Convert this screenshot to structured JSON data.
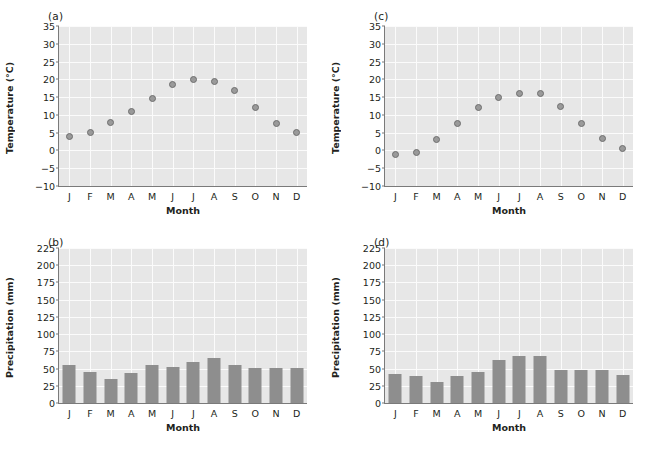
{
  "figure": {
    "months": [
      "J",
      "F",
      "M",
      "A",
      "M",
      "J",
      "J",
      "A",
      "S",
      "O",
      "N",
      "D"
    ],
    "xlabel": "Month",
    "temperature_axis_label": "Temperature (°C)",
    "precipitation_axis_label": "Precipitation (mm)",
    "temp_ticks": [
      "35",
      "30",
      "25",
      "20",
      "15",
      "10",
      "5",
      "0",
      "−5",
      "−10"
    ],
    "precip_ticks": [
      "225",
      "200",
      "175",
      "150",
      "125",
      "100",
      "75",
      "50",
      "25",
      "0"
    ],
    "marker_color": "#9a9a9a",
    "marker_edge_color": "#6e6e6e",
    "bar_color": "#8e8e8e",
    "plot_bg_color": "#e7e7e7",
    "grid_color": "#fbfbfb"
  },
  "panels": {
    "a": {
      "tag": "(a)"
    },
    "b": {
      "tag": "(b)"
    },
    "c": {
      "tag": "(c)"
    },
    "d": {
      "tag": "(d)"
    }
  },
  "chart_data": [
    {
      "panel": "a",
      "type": "scatter",
      "title": "(a)",
      "xlabel": "Month",
      "ylabel": "Temperature (°C)",
      "categories": [
        "J",
        "F",
        "M",
        "A",
        "M",
        "J",
        "J",
        "A",
        "S",
        "O",
        "N",
        "D"
      ],
      "values": [
        4,
        5,
        8,
        11,
        14.5,
        18.5,
        20,
        19.5,
        17,
        12,
        7.5,
        5
      ],
      "ylim": [
        -10,
        35
      ],
      "ytick_values": [
        -10,
        -5,
        0,
        5,
        10,
        15,
        20,
        25,
        30,
        35
      ],
      "grid": true,
      "legend": "none"
    },
    {
      "panel": "b",
      "type": "bar",
      "title": "(b)",
      "xlabel": "Month",
      "ylabel": "Precipitation (mm)",
      "categories": [
        "J",
        "F",
        "M",
        "A",
        "M",
        "J",
        "J",
        "A",
        "S",
        "O",
        "N",
        "D"
      ],
      "values": [
        55,
        45,
        35,
        43,
        55,
        52,
        59,
        65,
        55,
        51,
        51,
        51
      ],
      "ylim": [
        0,
        225
      ],
      "ytick_values": [
        0,
        25,
        50,
        75,
        100,
        125,
        150,
        175,
        200,
        225
      ],
      "grid": true,
      "legend": "none"
    },
    {
      "panel": "c",
      "type": "scatter",
      "title": "(c)",
      "xlabel": "Month",
      "ylabel": "Temperature (°C)",
      "categories": [
        "J",
        "F",
        "M",
        "A",
        "M",
        "J",
        "J",
        "A",
        "S",
        "O",
        "N",
        "D"
      ],
      "values": [
        -1,
        -0.5,
        3,
        7.5,
        12,
        15,
        16,
        16,
        12.5,
        7.5,
        3.5,
        0.5
      ],
      "ylim": [
        -10,
        35
      ],
      "ytick_values": [
        -10,
        -5,
        0,
        5,
        10,
        15,
        20,
        25,
        30,
        35
      ],
      "grid": true,
      "legend": "none"
    },
    {
      "panel": "d",
      "type": "bar",
      "title": "(d)",
      "xlabel": "Month",
      "ylabel": "Precipitation (mm)",
      "categories": [
        "J",
        "F",
        "M",
        "A",
        "M",
        "J",
        "J",
        "A",
        "S",
        "O",
        "N",
        "D"
      ],
      "values": [
        42,
        39,
        31,
        39,
        45,
        63,
        68,
        68,
        48,
        48,
        48,
        40
      ],
      "ylim": [
        0,
        225
      ],
      "ytick_values": [
        0,
        25,
        50,
        75,
        100,
        125,
        150,
        175,
        200,
        225
      ],
      "grid": true,
      "legend": "none"
    }
  ]
}
